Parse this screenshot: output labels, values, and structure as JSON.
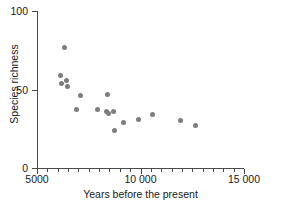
{
  "chart_data": {
    "type": "scatter",
    "title": "",
    "xlabel": "Years before the present",
    "ylabel": "Species richness",
    "xlim": [
      5000,
      15000
    ],
    "ylim": [
      0,
      100
    ],
    "grid": false,
    "legend": null,
    "marker_color": "#7d7d7d",
    "axis_color": "#4a4a4a",
    "x_ticks": [
      {
        "value": 5000,
        "label": "5000",
        "major": true
      },
      {
        "value": 5500,
        "label": "",
        "major": false
      },
      {
        "value": 6000,
        "label": "",
        "major": false
      },
      {
        "value": 6500,
        "label": "",
        "major": false
      },
      {
        "value": 7000,
        "label": "",
        "major": false
      },
      {
        "value": 7500,
        "label": "",
        "major": false
      },
      {
        "value": 8000,
        "label": "",
        "major": false
      },
      {
        "value": 8500,
        "label": "",
        "major": false
      },
      {
        "value": 9000,
        "label": "",
        "major": false
      },
      {
        "value": 9500,
        "label": "",
        "major": false
      },
      {
        "value": 10000,
        "label": "10 000",
        "major": true
      },
      {
        "value": 10500,
        "label": "",
        "major": false
      },
      {
        "value": 11000,
        "label": "",
        "major": false
      },
      {
        "value": 11500,
        "label": "",
        "major": false
      },
      {
        "value": 12000,
        "label": "",
        "major": false
      },
      {
        "value": 12500,
        "label": "",
        "major": false
      },
      {
        "value": 13000,
        "label": "",
        "major": false
      },
      {
        "value": 13500,
        "label": "",
        "major": false
      },
      {
        "value": 14000,
        "label": "",
        "major": false
      },
      {
        "value": 14500,
        "label": "",
        "major": false
      },
      {
        "value": 15000,
        "label": "15 000",
        "major": true
      }
    ],
    "y_ticks": [
      {
        "value": 0,
        "label": "0"
      },
      {
        "value": 50,
        "label": "50"
      },
      {
        "value": 100,
        "label": "100"
      }
    ],
    "points": [
      {
        "x": 6350,
        "y": 77
      },
      {
        "x": 6150,
        "y": 59
      },
      {
        "x": 6180,
        "y": 54
      },
      {
        "x": 6420,
        "y": 56
      },
      {
        "x": 6450,
        "y": 52
      },
      {
        "x": 7080,
        "y": 46
      },
      {
        "x": 6930,
        "y": 37
      },
      {
        "x": 7900,
        "y": 37
      },
      {
        "x": 8400,
        "y": 47
      },
      {
        "x": 8380,
        "y": 36
      },
      {
        "x": 8430,
        "y": 35
      },
      {
        "x": 8700,
        "y": 36
      },
      {
        "x": 8750,
        "y": 24
      },
      {
        "x": 9170,
        "y": 29
      },
      {
        "x": 9900,
        "y": 31
      },
      {
        "x": 10600,
        "y": 34
      },
      {
        "x": 11950,
        "y": 30
      },
      {
        "x": 12650,
        "y": 27
      }
    ]
  }
}
